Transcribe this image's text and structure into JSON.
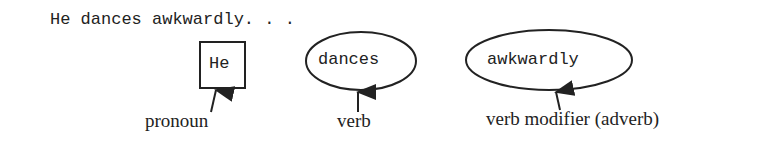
{
  "sentence": "He dances awkwardly. . .",
  "nodes": [
    {
      "word": "He",
      "shape": "box",
      "label": "pronoun"
    },
    {
      "word": "dances",
      "shape": "ellipse",
      "label": "verb"
    },
    {
      "word": "awkwardly",
      "shape": "ellipse",
      "label": "verb modifier (adverb)"
    }
  ]
}
